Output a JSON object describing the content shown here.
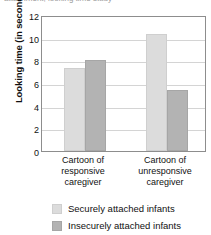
{
  "figure": {
    "cropped_top_caption": "attachment, looking time study"
  },
  "chart_data": {
    "type": "bar",
    "title": "",
    "xlabel": "",
    "ylabel": "Looking time (in seconds)",
    "categories": [
      "Cartoon of responsive caregiver",
      "Cartoon of unresponsive caregiver"
    ],
    "category_lines": [
      [
        "Cartoon of",
        "responsive",
        "caregiver"
      ],
      [
        "Cartoon of",
        "unresponsive",
        "caregiver"
      ]
    ],
    "series": [
      {
        "name": "Securely attached infants",
        "values": [
          7.3,
          10.3
        ],
        "color": "#dcdcdc"
      },
      {
        "name": "Insecurely attached infants",
        "values": [
          8.0,
          5.4
        ],
        "color": "#b3b3b3"
      }
    ],
    "ylim": [
      0,
      12
    ],
    "yticks": [
      0,
      2,
      4,
      6,
      8,
      10,
      12
    ],
    "ytick_labels": [
      "0",
      "2",
      "4",
      "6",
      "8",
      "10",
      "12"
    ],
    "grid": true,
    "legend_position": "below"
  }
}
